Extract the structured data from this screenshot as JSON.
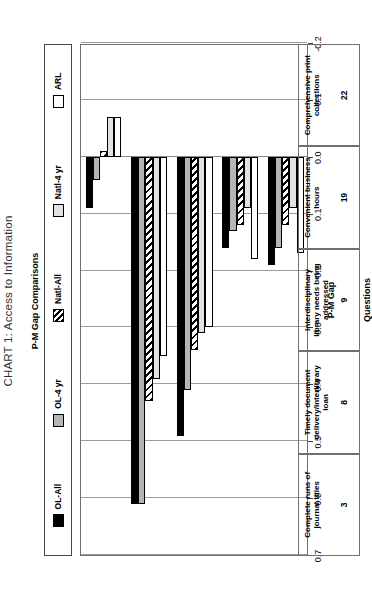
{
  "title": "CHART 1: Access to Information",
  "legend": {
    "title": "P-M Gap Comparisons",
    "items": [
      {
        "label": "OL-All",
        "pattern": "solid-black",
        "color": "#000000"
      },
      {
        "label": "OL-4 yr",
        "pattern": "solid-gray",
        "color": "#b5b5b5"
      },
      {
        "label": "Natl-All",
        "pattern": "diagonal-hatch",
        "color": "#000000"
      },
      {
        "label": "Natl-4 yr",
        "pattern": "solid-lightgray",
        "color": "#e2e2e2"
      },
      {
        "label": "ARL",
        "pattern": "solid-white",
        "color": "#ffffff"
      }
    ]
  },
  "axes": {
    "value_axis_label": "P-M Gap",
    "category_axis_label": "Questions",
    "ticks": [
      "0.7",
      "0.6",
      "0.5",
      "0.4",
      "0.3",
      "0.2",
      "0.1",
      "0.0",
      "-0.1",
      "-0.2"
    ],
    "tick_values": [
      0.7,
      0.6,
      0.5,
      0.4,
      0.3,
      0.2,
      0.1,
      0.0,
      -0.1,
      -0.2
    ],
    "limits": [
      0.7,
      -0.2
    ]
  },
  "chart_data": {
    "type": "bar",
    "title": "CHART 1: Access to Information",
    "subtitle": "P-M Gap Comparisons",
    "orientation": "horizontal",
    "xlabel": "Questions",
    "ylabel": "P-M Gap",
    "ylim": [
      -0.2,
      0.7
    ],
    "grid": true,
    "legend_position": "top",
    "categories": [
      "Complete runs of journal titles",
      "Timely document delivery/interlibrary loan",
      "Interdisciplinary library needs being addressed",
      "Convenient business hours",
      "Comprehensive print collections"
    ],
    "category_numbers": [
      "3",
      "8",
      "9",
      "19",
      "22"
    ],
    "series": [
      {
        "name": "OL-All",
        "values": [
          0.09,
          0.61,
          0.49,
          0.16,
          0.19
        ]
      },
      {
        "name": "OL-4 yr",
        "values": [
          0.04,
          0.61,
          0.41,
          0.13,
          0.16
        ]
      },
      {
        "name": "Natl-All",
        "values": [
          -0.01,
          0.43,
          0.34,
          0.12,
          0.12
        ]
      },
      {
        "name": "Natl-4 yr",
        "values": [
          -0.07,
          0.39,
          0.31,
          0.09,
          0.09
        ]
      },
      {
        "name": "ARL",
        "values": [
          -0.07,
          0.35,
          0.3,
          0.18,
          0.17
        ]
      }
    ]
  },
  "categories_display": [
    {
      "number": "3",
      "name": "Complete runs of\njournal titles"
    },
    {
      "number": "8",
      "name": "Timely document\ndelivery/interlibrary\nloan"
    },
    {
      "number": "9",
      "name": "Interdisciplinary\nlibrary needs being\naddressed"
    },
    {
      "number": "19",
      "name": "Convenient business\nhours"
    },
    {
      "number": "22",
      "name": "Comprehensive print\ncollections"
    }
  ]
}
